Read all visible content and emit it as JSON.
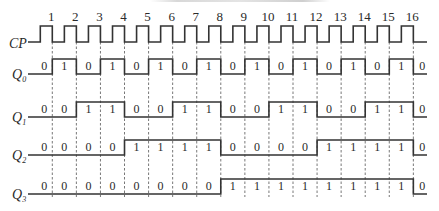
{
  "diagram": {
    "type": "timing-diagram",
    "colors": {
      "line": "#333333",
      "dashed": "#555555",
      "text": "#2a2a2a",
      "background": "#ffffff"
    },
    "clock": {
      "label": "CP",
      "pulse_numbers": [
        "1",
        "2",
        "3",
        "4",
        "5",
        "6",
        "7",
        "8",
        "9",
        "10",
        "11",
        "12",
        "13",
        "14",
        "15",
        "16"
      ],
      "pulse_count": 16
    },
    "signals": [
      {
        "label": "Q",
        "subscript": "0",
        "values": [
          0,
          1,
          0,
          1,
          0,
          1,
          0,
          1,
          0,
          1,
          0,
          1,
          0,
          1,
          0,
          1,
          0
        ]
      },
      {
        "label": "Q",
        "subscript": "1",
        "values": [
          0,
          0,
          1,
          1,
          0,
          0,
          1,
          1,
          0,
          0,
          1,
          1,
          0,
          0,
          1,
          1,
          0
        ]
      },
      {
        "label": "Q",
        "subscript": "2",
        "values": [
          0,
          0,
          0,
          0,
          1,
          1,
          1,
          1,
          0,
          0,
          0,
          0,
          1,
          1,
          1,
          1,
          0
        ]
      },
      {
        "label": "Q",
        "subscript": "3",
        "values": [
          0,
          0,
          0,
          0,
          0,
          0,
          0,
          0,
          1,
          1,
          1,
          1,
          1,
          1,
          1,
          1,
          0
        ]
      }
    ],
    "layout": {
      "x_start": 28,
      "x_end": 427,
      "first_fall": 52.3,
      "period": 24.07,
      "pulse_width": 12,
      "clock_high_y": 26,
      "clock_low_y": 42,
      "rows": [
        {
          "high_y": 59,
          "low_y": 74
        },
        {
          "high_y": 102,
          "low_y": 117
        },
        {
          "high_y": 140,
          "low_y": 155
        },
        {
          "high_y": 179,
          "low_y": 194
        }
      ],
      "dash_top": 42,
      "dash_bottom": 197
    }
  }
}
